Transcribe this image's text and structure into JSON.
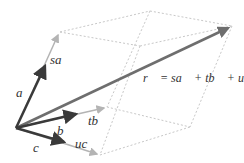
{
  "diagram": {
    "colors": {
      "basis_vector": "#3a3a3a",
      "scaled_vector": "#b4b4b4",
      "result_vector": "#6e6e6e",
      "box_edge": "#c8c8c8",
      "label": "#333333"
    },
    "labels": {
      "a": "a⃗",
      "b": "b⃗",
      "c": "c⃗",
      "sa": "sa⃗",
      "tb": "tb⃗",
      "uc": "uc⃗",
      "equation": "r⃗ = sa⃗ + tb⃗ + uc⃗"
    },
    "vectors": [
      {
        "name": "a",
        "kind": "basis"
      },
      {
        "name": "b",
        "kind": "basis"
      },
      {
        "name": "c",
        "kind": "basis"
      },
      {
        "name": "sa",
        "kind": "scaled"
      },
      {
        "name": "tb",
        "kind": "scaled"
      },
      {
        "name": "uc",
        "kind": "scaled"
      },
      {
        "name": "r",
        "kind": "result"
      }
    ]
  }
}
